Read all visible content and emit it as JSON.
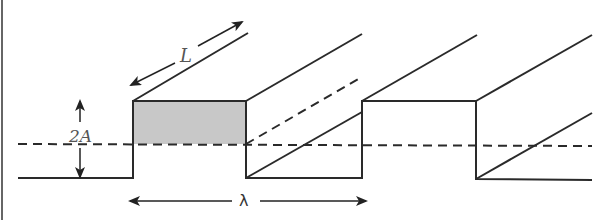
{
  "figure": {
    "labels": {
      "length": "L",
      "amplitude": "2A",
      "wavelength": "λ"
    },
    "colors": {
      "stroke": "#2a2a2a",
      "shade": "#c8c8c8",
      "border": "#555555",
      "background": "#ffffff"
    }
  }
}
